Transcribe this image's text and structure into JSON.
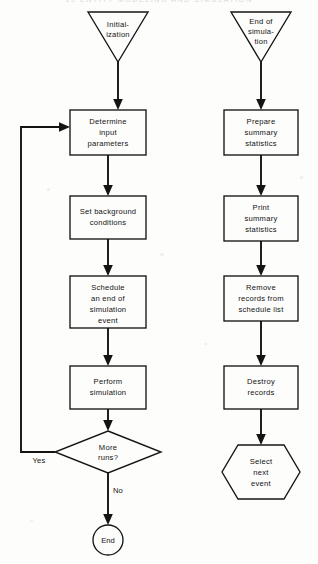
{
  "page": {
    "header_text": "10   ENTITY MODELING AND SIMULATION",
    "background_color": "#fdfdfc",
    "ink_color": "#141414"
  },
  "flowchart": {
    "left_column": {
      "start": {
        "id": "initialization",
        "shape": "inverted-triangle",
        "lines": [
          "Initial-",
          "ization"
        ]
      },
      "steps": [
        {
          "id": "determine-input-parameters",
          "shape": "process",
          "lines": [
            "Determine",
            "input",
            "parameters"
          ]
        },
        {
          "id": "set-background-conditions",
          "shape": "process",
          "lines": [
            "Set  background",
            "conditions"
          ]
        },
        {
          "id": "schedule-end-of-simulation-event",
          "shape": "process",
          "lines": [
            "Schedule",
            "an  end  of",
            "simulation",
            "event"
          ]
        },
        {
          "id": "perform-simulation",
          "shape": "process",
          "lines": [
            "Perform",
            "simulation"
          ]
        }
      ],
      "decision": {
        "id": "more-runs",
        "shape": "diamond",
        "lines": [
          "More",
          "runs?"
        ]
      },
      "branch_yes_label": "Yes",
      "branch_no_label": "No",
      "end": {
        "id": "end",
        "shape": "circle",
        "lines": [
          "End"
        ]
      }
    },
    "right_column": {
      "start": {
        "id": "end-of-simulation",
        "shape": "inverted-triangle",
        "lines": [
          "End of",
          "simula-",
          "tion"
        ]
      },
      "steps": [
        {
          "id": "prepare-summary-statistics",
          "shape": "process",
          "lines": [
            "Prepare",
            "summary",
            "statistics"
          ]
        },
        {
          "id": "print-summary-statistics",
          "shape": "process",
          "lines": [
            "Print",
            "summary",
            "statistics"
          ]
        },
        {
          "id": "remove-records-from-schedule-list",
          "shape": "process",
          "lines": [
            "Remove",
            "records  from",
            "schedule  list"
          ]
        },
        {
          "id": "destroy-records",
          "shape": "process",
          "lines": [
            "Destroy",
            "records"
          ]
        }
      ],
      "end": {
        "id": "select-next-event",
        "shape": "hexagon",
        "lines": [
          "Select",
          "next",
          "event"
        ]
      }
    }
  }
}
